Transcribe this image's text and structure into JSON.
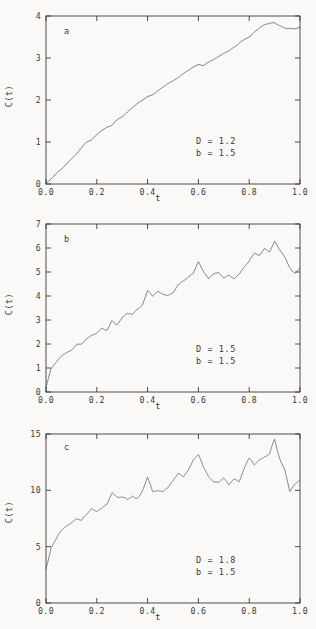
{
  "figure": {
    "background_color": "#faf9f7",
    "line_color": "#4a4a4a",
    "axis_color": "#3a3a3a"
  },
  "chart_data": [
    {
      "type": "line",
      "panel_label": "a",
      "title": "",
      "xlabel": "t",
      "ylabel": "C(t)",
      "xlim": [
        0.0,
        1.0
      ],
      "ylim": [
        0,
        4
      ],
      "xticks": [
        "0.0",
        "0.2",
        "0.4",
        "0.6",
        "0.8",
        "1.0"
      ],
      "xtick_values": [
        0.0,
        0.2,
        0.4,
        0.6,
        0.8,
        1.0
      ],
      "yticks": [
        "0",
        "1",
        "2",
        "3",
        "4"
      ],
      "ytick_values": [
        0,
        1,
        2,
        3,
        4
      ],
      "grid": false,
      "legend": "none",
      "annotations": [
        "D = 1.2",
        "b = 1.5"
      ],
      "params": {
        "D": "1.2",
        "b": "1.5"
      },
      "roughness": 0.055,
      "seed": 17,
      "samples": 260,
      "x": [
        0.0,
        0.02,
        0.04,
        0.06,
        0.08,
        0.1,
        0.12,
        0.14,
        0.16,
        0.18,
        0.2,
        0.22,
        0.24,
        0.26,
        0.28,
        0.3,
        0.32,
        0.34,
        0.36,
        0.38,
        0.4,
        0.42,
        0.44,
        0.46,
        0.48,
        0.5,
        0.52,
        0.54,
        0.56,
        0.58,
        0.6,
        0.62,
        0.64,
        0.66,
        0.68,
        0.7,
        0.72,
        0.74,
        0.76,
        0.78,
        0.8,
        0.82,
        0.84,
        0.86,
        0.88,
        0.9,
        0.92,
        0.94,
        0.96,
        0.98,
        1.0
      ],
      "y": [
        0.02,
        0.14,
        0.27,
        0.36,
        0.5,
        0.62,
        0.72,
        0.86,
        0.99,
        1.05,
        1.17,
        1.28,
        1.36,
        1.41,
        1.55,
        1.62,
        1.71,
        1.8,
        1.9,
        1.99,
        2.07,
        2.12,
        2.21,
        2.3,
        2.39,
        2.47,
        2.55,
        2.63,
        2.71,
        2.8,
        2.88,
        2.83,
        2.9,
        2.97,
        3.04,
        3.12,
        3.17,
        3.25,
        3.34,
        3.43,
        3.5,
        3.6,
        3.68,
        3.76,
        3.82,
        3.86,
        3.8,
        3.74,
        3.72,
        3.7,
        3.73
      ]
    },
    {
      "type": "line",
      "panel_label": "b",
      "title": "",
      "xlabel": "t",
      "ylabel": "C(t)",
      "xlim": [
        0.0,
        1.0
      ],
      "ylim": [
        0,
        7
      ],
      "xticks": [
        "0.0",
        "0.2",
        "0.4",
        "0.6",
        "0.8",
        "1.0"
      ],
      "xtick_values": [
        0.0,
        0.2,
        0.4,
        0.6,
        0.8,
        1.0
      ],
      "yticks": [
        "0",
        "1",
        "2",
        "3",
        "4",
        "5",
        "6",
        "7"
      ],
      "ytick_values": [
        0,
        1,
        2,
        3,
        4,
        5,
        6,
        7
      ],
      "grid": false,
      "legend": "none",
      "annotations": [
        "D = 1.5",
        "b = 1.5"
      ],
      "params": {
        "D": "1.5",
        "b": "1.5"
      },
      "roughness": 0.16,
      "seed": 43,
      "samples": 420,
      "x": [
        0.0,
        0.02,
        0.04,
        0.06,
        0.08,
        0.1,
        0.12,
        0.14,
        0.16,
        0.18,
        0.2,
        0.22,
        0.24,
        0.26,
        0.28,
        0.3,
        0.32,
        0.34,
        0.36,
        0.38,
        0.4,
        0.42,
        0.44,
        0.46,
        0.48,
        0.5,
        0.52,
        0.54,
        0.56,
        0.58,
        0.6,
        0.62,
        0.64,
        0.66,
        0.68,
        0.7,
        0.72,
        0.74,
        0.76,
        0.78,
        0.8,
        0.82,
        0.84,
        0.86,
        0.88,
        0.9,
        0.92,
        0.94,
        0.96,
        0.98,
        1.0
      ],
      "y": [
        0.2,
        1.0,
        1.25,
        1.45,
        1.62,
        1.75,
        1.98,
        2.0,
        2.25,
        2.4,
        2.5,
        2.72,
        2.62,
        3.0,
        2.85,
        3.15,
        3.3,
        3.2,
        3.45,
        3.6,
        4.2,
        3.95,
        4.15,
        4.05,
        4.0,
        4.1,
        4.45,
        4.6,
        4.75,
        4.9,
        5.45,
        5.0,
        4.7,
        4.95,
        5.05,
        4.85,
        4.95,
        4.8,
        5.0,
        5.3,
        5.5,
        5.8,
        5.7,
        6.0,
        5.85,
        6.25,
        5.9,
        5.6,
        5.2,
        5.0,
        5.25
      ]
    },
    {
      "type": "line",
      "panel_label": "c",
      "title": "",
      "xlabel": "t",
      "ylabel": "C(t)",
      "xlim": [
        0.0,
        1.0
      ],
      "ylim": [
        0,
        15
      ],
      "xticks": [
        "0.0",
        "0.2",
        "0.4",
        "0.6",
        "0.8",
        "1.0"
      ],
      "xtick_values": [
        0.0,
        0.2,
        0.4,
        0.6,
        0.8,
        1.0
      ],
      "yticks": [
        "0",
        "5",
        "10",
        "15"
      ],
      "ytick_values": [
        0,
        5,
        10,
        15
      ],
      "grid": false,
      "legend": "none",
      "annotations": [
        "D = 1.8",
        "b = 1.5"
      ],
      "params": {
        "D": "1.8",
        "b": "1.5"
      },
      "roughness": 0.62,
      "seed": 91,
      "samples": 900,
      "x": [
        0.0,
        0.02,
        0.04,
        0.06,
        0.08,
        0.1,
        0.12,
        0.14,
        0.16,
        0.18,
        0.2,
        0.22,
        0.24,
        0.26,
        0.28,
        0.3,
        0.32,
        0.34,
        0.36,
        0.38,
        0.4,
        0.42,
        0.44,
        0.46,
        0.48,
        0.5,
        0.52,
        0.54,
        0.56,
        0.58,
        0.6,
        0.62,
        0.64,
        0.66,
        0.68,
        0.7,
        0.72,
        0.74,
        0.76,
        0.78,
        0.8,
        0.82,
        0.84,
        0.86,
        0.88,
        0.9,
        0.92,
        0.94,
        0.96,
        0.98,
        1.0
      ],
      "y": [
        3.0,
        5.0,
        5.8,
        6.5,
        7.0,
        7.3,
        7.6,
        7.5,
        8.1,
        8.6,
        8.2,
        8.3,
        8.6,
        9.6,
        9.2,
        9.3,
        9.1,
        9.5,
        9.4,
        10.2,
        11.5,
        10.2,
        10.3,
        10.0,
        10.1,
        10.6,
        11.2,
        11.0,
        11.6,
        12.4,
        12.9,
        12.0,
        11.3,
        11.0,
        10.9,
        11.2,
        10.6,
        11.0,
        10.8,
        11.8,
        12.6,
        12.1,
        12.7,
        13.0,
        13.2,
        14.6,
        13.0,
        12.0,
        10.0,
        10.6,
        11.0
      ]
    }
  ]
}
